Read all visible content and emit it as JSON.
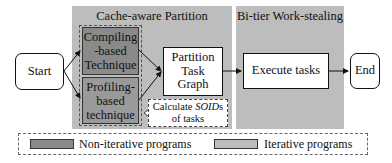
{
  "panels": {
    "partition": {
      "title": "Cache-aware Partition",
      "color": "#bdbdbd"
    },
    "worksteal": {
      "title": "Bi-tier Work-stealing",
      "color": "#bdbdbd"
    }
  },
  "nodes": {
    "start": "Start",
    "compiling": [
      "Compiling",
      "-based",
      "Technique"
    ],
    "profiling": [
      "Profiling-",
      "based",
      "technique"
    ],
    "partition_graph": [
      "Partition",
      "Task",
      "Graph"
    ],
    "execute": "Execute tasks",
    "end": "End"
  },
  "note": {
    "line1_prefix": "Calculate ",
    "line1_italic": "SOID",
    "line1_suffix": "s",
    "line2": "of tasks"
  },
  "legend": {
    "items": [
      {
        "label": "Non-iterative programs",
        "color": "#8a8a8a"
      },
      {
        "label": "Iterative programs",
        "color": "#bdbdbd"
      }
    ]
  }
}
